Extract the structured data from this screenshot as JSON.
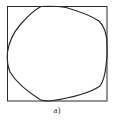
{
  "figure": {
    "caption": "a)",
    "stroke_color": "#2a2a2a",
    "square": {
      "x": 7,
      "y": 6,
      "width": 100,
      "height": 95
    },
    "curve_description": "closed rounded convex curve inscribed in square, touching all four sides"
  }
}
